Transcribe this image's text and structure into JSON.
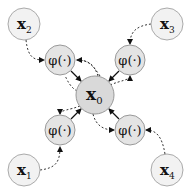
{
  "diagram": {
    "center": {
      "label": "x",
      "subscript": "0",
      "fill": "#d9d9d9"
    },
    "phi_label": "φ(·)",
    "phi_fill": "#e4e4e4",
    "input_fill": "#f2f2f2",
    "inputs": [
      {
        "id": "x2",
        "label": "x",
        "subscript": "2",
        "position": "top-left"
      },
      {
        "id": "x3",
        "label": "x",
        "subscript": "3",
        "position": "top-right"
      },
      {
        "id": "x1",
        "label": "x",
        "subscript": "1",
        "position": "bottom-left"
      },
      {
        "id": "x4",
        "label": "x",
        "subscript": "4",
        "position": "bottom-right"
      }
    ],
    "edges": {
      "input_to_phi": "dotted-curved-arrow",
      "phi_to_center": "solid-arrow",
      "center_to_phi": "dotted-curved-arrow"
    }
  }
}
